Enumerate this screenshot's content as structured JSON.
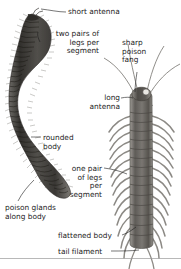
{
  "figure": {
    "background_color": "#ffffff",
    "ink_color": "#1c1c1c",
    "body_fill_dark": "#4a4845",
    "body_fill_mid": "#76736e",
    "body_fill_light": "#a9a6a1",
    "leg_color": "#8a8783",
    "rule_color": "#9a9a9a"
  },
  "labels": {
    "short_antenna": "short antenna",
    "two_pairs_legs": "two pairs of\nlegs per\nsegment",
    "sharp_poison_fang": "sharp\npoison\nfang",
    "long_antenna": "long\nantenna",
    "rounded_body": "rounded\nbody",
    "one_pair_legs": "one pair\nof legs\nper\nsegment",
    "poison_glands": "poison glands\nalong body",
    "flattened_body": "flattened body",
    "tail_filament": "tail filament"
  },
  "specimens": {
    "left": {
      "name": "millipede",
      "orientation": "s-curved-vertical",
      "segment_count": 58,
      "features": [
        "short antenna",
        "two pairs of legs per segment",
        "rounded body",
        "poison glands along body"
      ]
    },
    "right": {
      "name": "centipede",
      "orientation": "upright-vertical",
      "segment_count": 17,
      "features": [
        "sharp poison fang",
        "long antenna",
        "one pair of legs per segment",
        "flattened body",
        "tail filament"
      ]
    }
  }
}
